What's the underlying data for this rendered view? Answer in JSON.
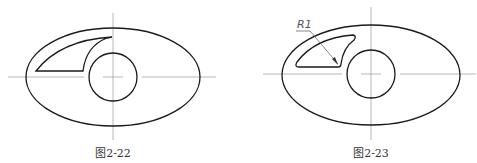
{
  "figures": [
    {
      "id": "fig-2-22",
      "caption": "图2-22",
      "dimension_label": null
    },
    {
      "id": "fig-2-23",
      "caption": "图2-23",
      "dimension_label": "R1"
    }
  ],
  "colors": {
    "outline": "#1a1a1a",
    "centerline": "#777777",
    "text": "#333333"
  }
}
